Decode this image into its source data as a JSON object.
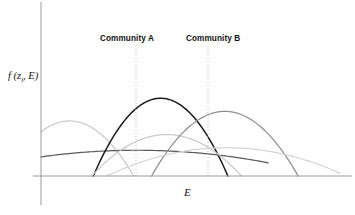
{
  "figure": {
    "width": 355,
    "height": 215,
    "background": "#ffffff"
  },
  "axes": {
    "x_label": "E",
    "y_label_main": "f (z",
    "y_label_sub": "i",
    "y_label_tail": ", E)",
    "y_axis_color": "#9a9a9a",
    "x_axis_color": "#9a9a9a",
    "x_axis_y_px": 176,
    "y_axis_x_px": 41
  },
  "annotations": [
    {
      "name": "community-a",
      "label": "Community A",
      "guide_x_px": 136,
      "guide_top_px": 46,
      "guide_bottom_px": 176,
      "guide_color": "#bdbdbd",
      "guide_style": "dotted"
    },
    {
      "name": "community-b",
      "label": "Community B",
      "guide_x_px": 208,
      "guide_top_px": 46,
      "guide_bottom_px": 176,
      "guide_color": "#bdbdbd",
      "guide_style": "dotted"
    }
  ],
  "chart_data": {
    "type": "line",
    "title": "",
    "subtitle": "",
    "xlabel": "E",
    "ylabel": "f (z_i, E)",
    "xlim": [
      0,
      1
    ],
    "ylim": [
      0,
      1
    ],
    "grid": false,
    "legend": "none",
    "axis_ticks": "none",
    "annotations": [
      "Community A",
      "Community B"
    ],
    "series": [
      {
        "name": "curve-1-light-gray-left",
        "color": "#c8c8c8",
        "peak_x": 0.095,
        "peak_y": 0.545,
        "half_width": 0.215,
        "start_x": 0.0,
        "end_x": 0.31,
        "stroke_width": 1.2
      },
      {
        "name": "curve-2-dark-gray-broad-left",
        "color": "#5a5a5a",
        "peak_x": 0.32,
        "peak_y": 0.255,
        "half_width": 0.63,
        "start_x": 0.0,
        "end_x": 0.76,
        "stroke_width": 1.2
      },
      {
        "name": "curve-3-black-center",
        "color": "#1a1a1a",
        "peak_x": 0.4,
        "peak_y": 0.77,
        "half_width": 0.225,
        "start_x": 0.175,
        "end_x": 0.625,
        "stroke_width": 1.5
      },
      {
        "name": "curve-4-light-gray-center",
        "color": "#c8c8c8",
        "peak_x": 0.42,
        "peak_y": 0.41,
        "half_width": 0.25,
        "start_x": 0.17,
        "end_x": 0.67,
        "stroke_width": 1.2
      },
      {
        "name": "curve-5-medium-gray-right",
        "color": "#8c8c8c",
        "peak_x": 0.615,
        "peak_y": 0.64,
        "half_width": 0.245,
        "start_x": 0.37,
        "end_x": 0.86,
        "stroke_width": 1.2
      },
      {
        "name": "curve-6-very-light-gray-broad-right",
        "color": "#d4d4d4",
        "peak_x": 0.62,
        "peak_y": 0.28,
        "half_width": 0.4,
        "start_x": 0.22,
        "end_x": 1.0,
        "stroke_width": 1.2
      }
    ]
  }
}
